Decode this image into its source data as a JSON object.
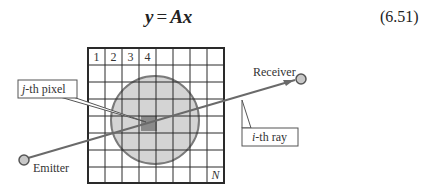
{
  "equation": {
    "lhs": "y",
    "equals": "=",
    "rhs": "Ax",
    "number": "(6.51)"
  },
  "diagram": {
    "grid": {
      "rows": 8,
      "cols": 8,
      "column_labels": [
        "1",
        "2",
        "3",
        "4"
      ],
      "last_cell_label": "N"
    },
    "labels": {
      "pixel_callout_italic": "j",
      "pixel_callout_rest": "-th pixel",
      "ray_callout_italic": "i",
      "ray_callout_rest": "-th ray",
      "receiver": "Receiver",
      "emitter": "Emitter"
    },
    "colors": {
      "grid_line": "#2a2a2a",
      "object_fill": "#d4d4d4",
      "object_stroke": "#7a7a7a",
      "pixel_fill": "#8a8a8a",
      "ray": "#6a6a6a",
      "node_fill": "#c8c8c8"
    }
  }
}
